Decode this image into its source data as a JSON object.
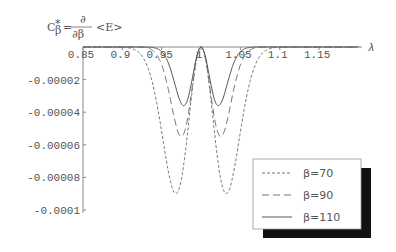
{
  "chart_data": {
    "type": "line",
    "title_parts": {
      "lhs": "C",
      "lhs_sup": "*",
      "lhs_sub": "β",
      "eq": "=",
      "num": "∂",
      "den": "∂β",
      "rhs": "<E>"
    },
    "xlabel": "λ",
    "ylabel": "",
    "xlim": [
      0.85,
      1.2
    ],
    "ylim": [
      -0.0001,
      0.0
    ],
    "grid": false,
    "legend_position": "lower right (with drop shadow)",
    "x_ticks": [
      "0.85",
      "0.9",
      "0.95",
      "1",
      "1.05",
      "1.1",
      "1.15"
    ],
    "x_tick_values": [
      0.85,
      0.9,
      0.95,
      1.0,
      1.05,
      1.1,
      1.15
    ],
    "y_ticks": [
      "-0.00002",
      "-0.00004",
      "-0.00006",
      "-0.00008",
      "-0.0001"
    ],
    "y_tick_values": [
      -2e-05,
      -4e-05,
      -6e-05,
      -8e-05,
      -0.0001
    ],
    "series": [
      {
        "name": "β=70",
        "style": "dotted",
        "min_value": -9e-05,
        "min_lambda": [
          0.968,
          1.032
        ],
        "peak_lambda": 1.0,
        "peak_value": 0.0
      },
      {
        "name": "β=90",
        "style": "dashed",
        "min_value": -5.5e-05,
        "min_lambda": [
          0.975,
          1.025
        ],
        "peak_lambda": 1.0,
        "peak_value": 0.0
      },
      {
        "name": "β=110",
        "style": "solid",
        "min_value": -3.6e-05,
        "min_lambda": [
          0.978,
          1.022
        ],
        "peak_lambda": 1.0,
        "peak_value": 0.0
      }
    ]
  },
  "legend": {
    "items": [
      {
        "label": "β=70",
        "style": "dotted"
      },
      {
        "label": "β=90",
        "style": "dashed"
      },
      {
        "label": "β=110",
        "style": "solid"
      }
    ]
  },
  "axis": {
    "x_label": "λ"
  }
}
